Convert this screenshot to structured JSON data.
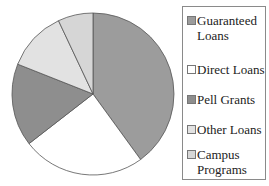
{
  "chart_data": {
    "type": "pie",
    "title": "",
    "categories": [
      "Guaranteed Loans",
      "Direct Loans",
      "Pell Grants",
      "Other Loans",
      "Campus Programs"
    ],
    "values": [
      40,
      24.5,
      16.5,
      12,
      7
    ],
    "unit": "percent (estimated)",
    "colors": [
      "#9c9c9c",
      "#ffffff",
      "#8e8e8e",
      "#e2e2e2",
      "#d6d6d6"
    ],
    "start_angle": "12 o'clock",
    "direction": "clockwise",
    "legend_position": "right"
  },
  "legend": {
    "items": [
      {
        "line1": "Guaranteed",
        "line2": "Loans",
        "color": "#9c9c9c"
      },
      {
        "line1": "Direct Loans",
        "line2": "",
        "color": "#ffffff"
      },
      {
        "line1": "Pell Grants",
        "line2": "",
        "color": "#8e8e8e"
      },
      {
        "line1": "Other Loans",
        "line2": "",
        "color": "#e2e2e2"
      },
      {
        "line1": "Campus",
        "line2": "Programs",
        "color": "#d6d6d6"
      }
    ]
  }
}
